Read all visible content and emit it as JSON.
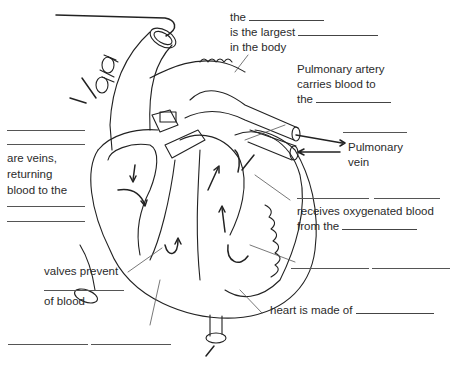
{
  "diagram": {
    "labels": {
      "aorta_line1": "the",
      "aorta_line2": "is the largest",
      "aorta_line3": "in the body",
      "pulmonary_artery_line1": "Pulmonary artery",
      "pulmonary_artery_line2": "carries blood to",
      "pulmonary_artery_line3": "the",
      "pulmonary_vein_line1": "Pulmonary",
      "pulmonary_vein_line2": "vein",
      "veins_line1": "are veins,",
      "veins_line2": "returning",
      "veins_line3": "blood to the",
      "left_atrium_line1": "receives oxygenated blood",
      "left_atrium_line2": "from the",
      "valves_line1": "valves prevent",
      "valves_line2": "of blood",
      "muscle_line": "heart is made of"
    },
    "colors": {
      "ink": "#2b2b2b",
      "paper": "#ffffff"
    }
  }
}
